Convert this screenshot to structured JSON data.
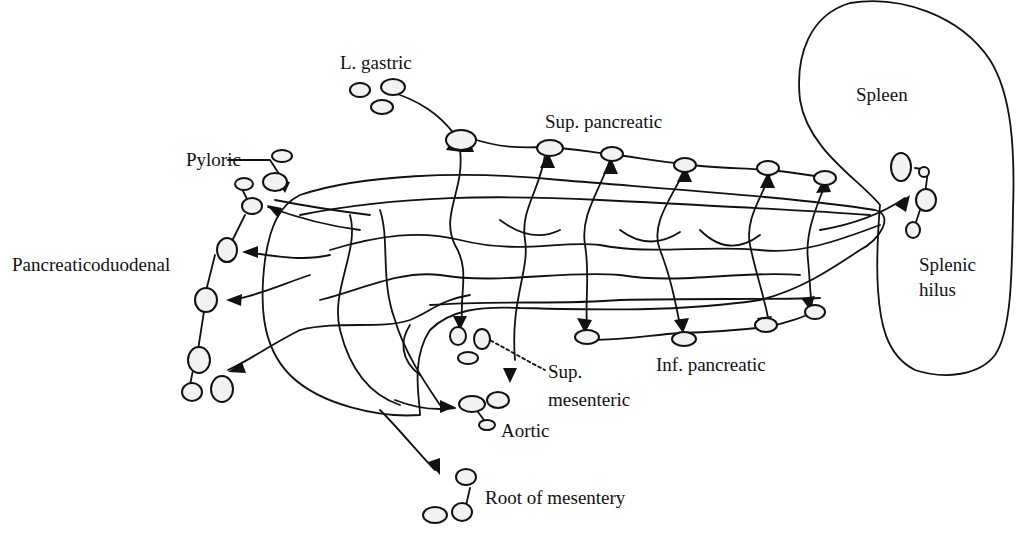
{
  "diagram": {
    "type": "anatomical-lymphatic-drainage",
    "labels": {
      "l_gastric": "L. gastric",
      "sup_pancreatic": "Sup. pancreatic",
      "spleen": "Spleen",
      "pyloric": "Pyloric",
      "pancreaticoduodenal": "Pancreaticoduodenal",
      "splenic_hilus_1": "Splenic",
      "splenic_hilus_2": "hilus",
      "sup_mesenteric_1": "Sup.",
      "sup_mesenteric_2": "mesenteric",
      "inf_pancreatic": "Inf. pancreatic",
      "aortic": "Aortic",
      "root_of_mesentery": "Root of mesentery"
    },
    "node_groups": [
      {
        "name": "L. gastric",
        "node_count": 3
      },
      {
        "name": "Sup. pancreatic",
        "node_count": 6
      },
      {
        "name": "Pyloric",
        "node_count": 4
      },
      {
        "name": "Pancreaticoduodenal",
        "node_count": 5
      },
      {
        "name": "Splenic hilus",
        "node_count": 4
      },
      {
        "name": "Sup. mesenteric",
        "node_count": 3
      },
      {
        "name": "Inf. pancreatic",
        "node_count": 4
      },
      {
        "name": "Aortic",
        "node_count": 3
      },
      {
        "name": "Root of mesentery",
        "node_count": 3
      }
    ],
    "organs": [
      "Pancreas",
      "Spleen"
    ]
  }
}
